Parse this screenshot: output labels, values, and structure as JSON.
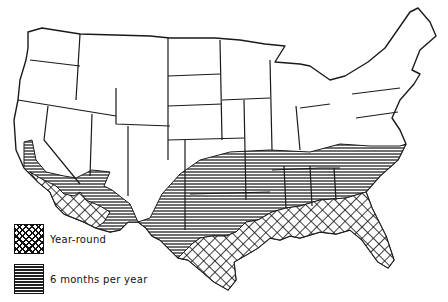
{
  "map": {
    "subject": "Contiguous United States",
    "style": "black-and-white line drawing with hatched regions"
  },
  "legend": {
    "items": [
      {
        "label": "Year-round",
        "pattern": "crosshatch",
        "color": "#111111"
      },
      {
        "label": "6 months per year",
        "pattern": "horizontal-lines",
        "color": "#111111"
      }
    ]
  },
  "regions": [
    {
      "name": "Gulf coast, Florida, south Texas, southern Arizona/California",
      "category": "Year-round"
    },
    {
      "name": "Southern states band from California to Virginia",
      "category": "6 months per year"
    }
  ]
}
